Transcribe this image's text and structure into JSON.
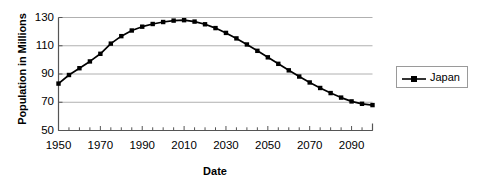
{
  "chart_data": {
    "type": "line",
    "title": "",
    "xlabel": "Date",
    "ylabel": "Population in Millions",
    "xlim": [
      1950,
      2100
    ],
    "ylim": [
      50,
      130
    ],
    "ytick_labels": [
      "130",
      "110",
      "90",
      "70",
      "50"
    ],
    "ytick_values": [
      130,
      110,
      90,
      70,
      50
    ],
    "xtick_labels": [
      "1950",
      "1970",
      "1990",
      "2010",
      "2030",
      "2050",
      "2070",
      "2090"
    ],
    "xtick_values": [
      1950,
      1970,
      1990,
      2010,
      2030,
      2050,
      2070,
      2090
    ],
    "minor_tick_interval": 5,
    "grid": "horizontal",
    "legend_position": "right",
    "legend": [
      "Japan"
    ],
    "series": [
      {
        "name": "Japan",
        "color": "#000000",
        "marker": "square",
        "x": [
          1950,
          1955,
          1960,
          1965,
          1970,
          1975,
          1980,
          1985,
          1990,
          1995,
          2000,
          2005,
          2010,
          2015,
          2020,
          2025,
          2030,
          2035,
          2040,
          2045,
          2050,
          2055,
          2060,
          2065,
          2070,
          2075,
          2080,
          2085,
          2090,
          2095,
          2100
        ],
        "values": [
          83.2,
          89.3,
          94.1,
          98.9,
          104.3,
          111.5,
          116.8,
          120.8,
          123.5,
          125.4,
          126.8,
          127.8,
          128.1,
          127.1,
          125.2,
          122.5,
          119.1,
          115.2,
          110.9,
          106.4,
          101.8,
          97.2,
          92.6,
          88.2,
          84.0,
          80.1,
          76.5,
          73.3,
          70.6,
          68.9,
          68.0
        ]
      }
    ]
  },
  "axis_titles": {
    "x": "Date",
    "y": "Population in Millions"
  },
  "legend": {
    "entries": [
      {
        "label": "Japan",
        "symbol": "line-marker-symbol"
      }
    ]
  }
}
